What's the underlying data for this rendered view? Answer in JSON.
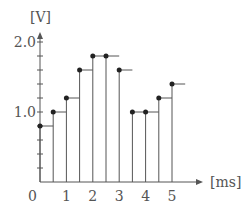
{
  "chart_data": {
    "type": "step",
    "title": "",
    "xlabel": "[ms]",
    "ylabel": "[V]",
    "origin_label": "0",
    "x_ticks": [
      1,
      2,
      3,
      4,
      5
    ],
    "x_tick_labels": [
      "1",
      "2",
      "3",
      "4",
      "5"
    ],
    "y_tick_labels": [
      {
        "value": 1.0,
        "label": "1.0"
      },
      {
        "value": 2.0,
        "label": "2.0"
      }
    ],
    "y_minor_step": 0.2,
    "xlim": [
      0,
      5.5
    ],
    "ylim": [
      0,
      2.0
    ],
    "sample_interval": 0.5,
    "x": [
      0.0,
      0.5,
      1.0,
      1.5,
      2.0,
      2.5,
      3.0,
      3.5,
      4.0,
      4.5,
      5.0
    ],
    "values": [
      0.8,
      1.0,
      1.2,
      1.6,
      1.8,
      1.8,
      1.6,
      1.0,
      1.0,
      1.2,
      1.4
    ],
    "grid": false,
    "legend": null,
    "colors": {
      "axis": "#555555",
      "line": "#555555",
      "point": "#222222"
    }
  }
}
